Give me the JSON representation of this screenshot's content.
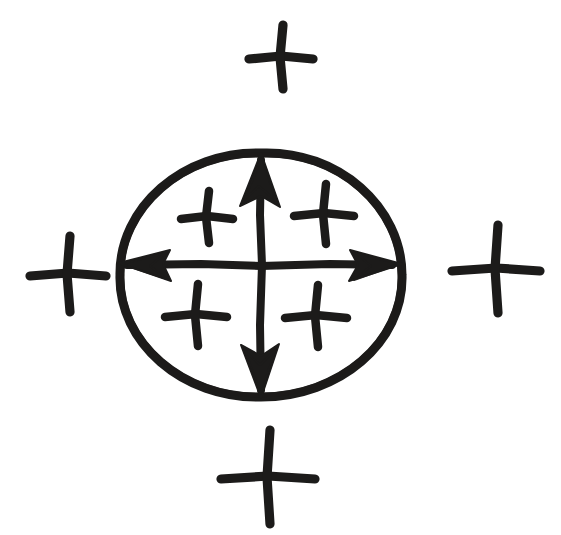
{
  "image": {
    "title": "Hand-drawn expansion diagram",
    "description": "Ink sketch of an oval containing a four-headed cross arrow, four plus signs inside the oval quadrants and four plus signs outside the oval at the cardinal directions",
    "background_color": "#ffffff",
    "ink_color": "#1c1b1a",
    "width": 561,
    "height": 535
  },
  "shapes": {
    "ellipse": {
      "name": "hand-drawn-ellipse",
      "center_x": 261,
      "center_y": 275,
      "radius_x": 141,
      "radius_y": 122
    },
    "cross_arrow": {
      "name": "four-way-arrow",
      "center_x": 261,
      "center_y": 265,
      "horizontal": {
        "x1": 121,
        "x2": 400,
        "y": 265
      },
      "vertical": {
        "y1": 156,
        "y2": 396,
        "x": 261
      },
      "arrowheads": [
        "up",
        "down",
        "left",
        "right"
      ]
    },
    "inner_plus_signs": [
      {
        "name": "inner-plus-top-left",
        "cx": 207,
        "cy": 217,
        "arm": 26
      },
      {
        "name": "inner-plus-top-right",
        "cx": 324,
        "cy": 214,
        "arm": 30
      },
      {
        "name": "inner-plus-bottom-left",
        "cx": 196,
        "cy": 315,
        "arm": 31
      },
      {
        "name": "inner-plus-bottom-right",
        "cx": 316,
        "cy": 316,
        "arm": 31
      }
    ],
    "outer_plus_signs": [
      {
        "name": "outer-plus-top",
        "cx": 281,
        "cy": 57,
        "arm": 32
      },
      {
        "name": "outer-plus-left",
        "cx": 68,
        "cy": 274,
        "arm": 38
      },
      {
        "name": "outer-plus-right",
        "cx": 496,
        "cy": 269,
        "arm": 44
      },
      {
        "name": "outer-plus-bottom",
        "cx": 268,
        "cy": 477,
        "arm": 47
      }
    ]
  },
  "labels": {
    "caption": ""
  }
}
